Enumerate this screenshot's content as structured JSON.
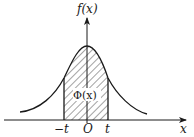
{
  "diagram": {
    "y_axis_label": "f(x)",
    "x_axis_label": "x",
    "origin_label": "O",
    "left_bound_label": "−t",
    "right_bound_label": "t",
    "area_label": "Φ(x)",
    "colors": {
      "stroke": "#1a1a1a",
      "background": "#ffffff"
    }
  }
}
